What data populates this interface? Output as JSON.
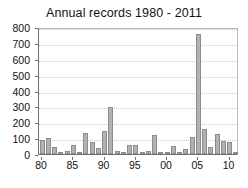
{
  "chart_data": {
    "type": "bar",
    "title": "Annual records 1980 - 2011",
    "xlabel": "",
    "ylabel": "",
    "ylim": [
      0,
      800
    ],
    "ytick_step": 100,
    "yticks": [
      0,
      100,
      200,
      300,
      400,
      500,
      600,
      700,
      800
    ],
    "ytick_labels": [
      "0",
      "100",
      "200",
      "300",
      "400",
      "500",
      "600",
      "700",
      "800"
    ],
    "xticks": [
      1980,
      1985,
      1990,
      1995,
      2000,
      2005,
      2010
    ],
    "xtick_labels": [
      "80",
      "85",
      "90",
      "95",
      "00",
      "05",
      "10"
    ],
    "grid": true,
    "grid_axis": "y",
    "legend": null,
    "categories": [
      "1980",
      "1981",
      "1982",
      "1983",
      "1984",
      "1985",
      "1986",
      "1987",
      "1988",
      "1989",
      "1990",
      "1991",
      "1992",
      "1993",
      "1994",
      "1995",
      "1996",
      "1997",
      "1998",
      "1999",
      "2000",
      "2001",
      "2002",
      "2003",
      "2004",
      "2005",
      "2006",
      "2007",
      "2008",
      "2009",
      "2010",
      "2011"
    ],
    "values": [
      88,
      100,
      42,
      8,
      20,
      54,
      12,
      130,
      76,
      38,
      146,
      294,
      18,
      14,
      58,
      58,
      14,
      22,
      120,
      4,
      10,
      52,
      8,
      34,
      108,
      755,
      158,
      42,
      126,
      82,
      74,
      6
    ],
    "bar_color": "#b2b2b2",
    "bar_edge_color": "#8c8c8c"
  },
  "axes": {
    "axis_color": "#6e6e6e",
    "grid_color": "#c9c9c9"
  }
}
